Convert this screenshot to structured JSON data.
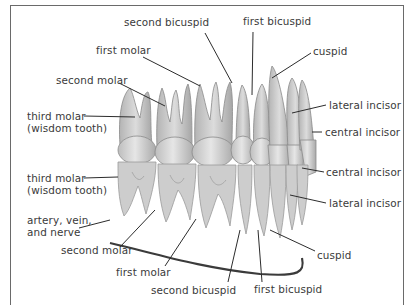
{
  "figure": {
    "upper_jaw_labels": [
      {
        "id": "u-second-bicuspid",
        "text": "second bicuspid",
        "x": 152,
        "y": 21
      },
      {
        "id": "u-first-bicuspid",
        "text": "first bicuspid",
        "x": 244,
        "y": 20
      },
      {
        "id": "u-first-molar",
        "text": "first molar",
        "x": 96,
        "y": 44
      },
      {
        "id": "u-cuspid",
        "text": "cuspid",
        "x": 313,
        "y": 45
      },
      {
        "id": "u-second-molar",
        "text": "second molar",
        "x": 56,
        "y": 73
      },
      {
        "id": "u-third-molar-1",
        "text": "third molar",
        "x": 27,
        "y": 109
      },
      {
        "id": "u-third-molar-2",
        "text": "(wisdom tooth)",
        "x": 27,
        "y": 121
      },
      {
        "id": "u-lateral-incisor",
        "text": "lateral incisor",
        "x": 328,
        "y": 99
      },
      {
        "id": "u-central-incisor",
        "text": "central incisor",
        "x": 324,
        "y": 125
      }
    ],
    "lower_jaw_labels": [
      {
        "id": "l-third-molar-1",
        "text": "third molar",
        "x": 27,
        "y": 173
      },
      {
        "id": "l-third-molar-2",
        "text": "(wisdom tooth)",
        "x": 27,
        "y": 185
      },
      {
        "id": "l-central-incisor",
        "text": "central incisor",
        "x": 326,
        "y": 166
      },
      {
        "id": "l-lateral-incisor",
        "text": "lateral incisor",
        "x": 329,
        "y": 197
      },
      {
        "id": "l-artery-1",
        "text": "artery, vein,",
        "x": 27,
        "y": 213
      },
      {
        "id": "l-artery-2",
        "text": "and nerve",
        "x": 27,
        "y": 225
      },
      {
        "id": "l-second-molar",
        "text": "second molar",
        "x": 61,
        "y": 244
      },
      {
        "id": "l-cuspid",
        "text": "cuspid",
        "x": 317,
        "y": 249
      },
      {
        "id": "l-first-molar",
        "text": "first molar",
        "x": 116,
        "y": 265
      },
      {
        "id": "l-second-bicuspid",
        "text": "second bicuspid",
        "x": 151,
        "y": 283
      },
      {
        "id": "l-first-bicuspid",
        "text": "first bicuspid",
        "x": 254,
        "y": 283
      }
    ]
  }
}
